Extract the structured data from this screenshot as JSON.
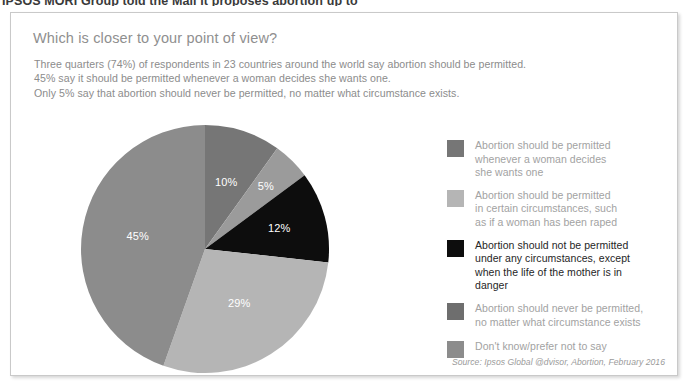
{
  "page": {
    "clipped_headline": "IPSOS MORI Group told the Mail it proposes abortion up to"
  },
  "card": {
    "title": "Which is closer to your point of view?",
    "subtitle_lines": [
      "Three quarters (74%) of respondents in 23 countries around the world say abortion should be permitted.",
      "45% say it should be permitted whenever a woman decides she wants one.",
      "Only 5% say that abortion should never be permitted, no matter what circumstance exists."
    ],
    "source": "Source: Ipsos Global @dvisor, Abortion, February 2016"
  },
  "chart_data": {
    "type": "pie",
    "title": "Which is closer to your point of view?",
    "legend_position": "right",
    "start_angle_deg": 0,
    "direction": "clockwise",
    "categories": [
      "Abortion should be permitted whenever a woman decides she wants one",
      "Abortion should be permitted in certain circumstances, such as if a woman has been raped",
      "Abortion should not be permitted under any circumstances, except when the life of the mother is in danger",
      "Abortion should never be permitted, no matter what circumstance exists",
      "Don't know/prefer not to say"
    ],
    "values": [
      45,
      29,
      12,
      5,
      10
    ],
    "slices": [
      {
        "order": 1,
        "label": "10%",
        "value": 10,
        "color": "#767676",
        "category": "Don't know/prefer not to say"
      },
      {
        "order": 2,
        "label": "5%",
        "value": 5,
        "color": "#9b9b9b",
        "category": "Abortion should never be permitted, no matter what circumstance exists"
      },
      {
        "order": 3,
        "label": "12%",
        "value": 12,
        "color": "#0d0d0d",
        "category": "Abortion should not be permitted under any circumstances, except when the life of the mother is in danger"
      },
      {
        "order": 4,
        "label": "29%",
        "value": 29,
        "color": "#b5b5b5",
        "category": "Abortion should be permitted in certain circumstances, such as if a woman has been raped"
      },
      {
        "order": 5,
        "label": "45%",
        "value": 45,
        "color": "#8c8c8c",
        "category": "Abortion should be permitted whenever a woman decides she wants one"
      }
    ]
  },
  "legend": {
    "items": [
      {
        "color": "#767676",
        "lines": [
          "Abortion should be permitted",
          "whenever a woman decides",
          "she wants one"
        ],
        "emphasis": false
      },
      {
        "color": "#b5b5b5",
        "lines": [
          "Abortion should be permitted",
          "in certain circumstances, such",
          "as if a woman has been raped"
        ],
        "emphasis": false
      },
      {
        "color": "#0d0d0d",
        "lines": [
          "Abortion should not be permitted",
          "under any circumstances, except",
          "when the life of the mother is in",
          "danger"
        ],
        "emphasis": true
      },
      {
        "color": "#6e6e6e",
        "lines": [
          "Abortion should never be permitted,",
          "no matter what circumstance exists"
        ],
        "emphasis": false
      },
      {
        "color": "#8c8c8c",
        "lines": [
          "Don't know/prefer not to say"
        ],
        "emphasis": false
      }
    ]
  }
}
